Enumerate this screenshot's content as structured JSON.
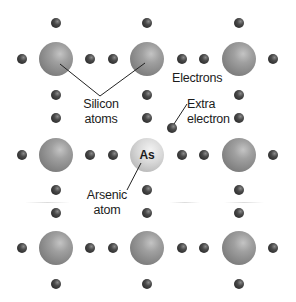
{
  "labels": {
    "silicon_line1": "Silicon",
    "silicon_line2": "atoms",
    "electrons": "Electrons",
    "extra_line1": "Extra",
    "extra_line2": "electron",
    "arsenic_line1": "Arsenic",
    "arsenic_line2": "atom",
    "arsenic_symbol": "As"
  },
  "colors": {
    "silicon_atom": "#8f8f8f",
    "arsenic_atom": "#d6d6d6",
    "electron": "#3a3a3a",
    "leader_line": "#222222",
    "text": "#1c1c1c"
  },
  "lattice": {
    "columns_x": [
      56,
      147,
      239
    ],
    "rows_y": [
      59,
      155,
      248
    ],
    "atom_radius": 17,
    "electron_radius": 5,
    "arsenic_position": {
      "col": 1,
      "row": 1
    }
  },
  "extra_electron": {
    "x": 172,
    "y": 128
  }
}
